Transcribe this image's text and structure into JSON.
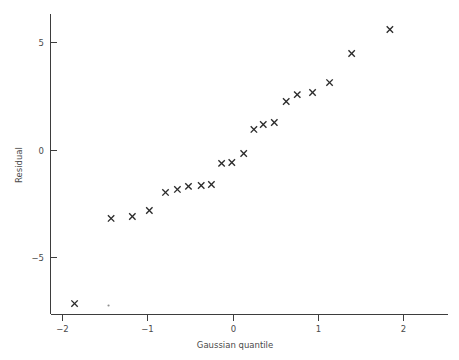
{
  "figure": {
    "background_color": "#ffffff",
    "ink_color": "#3d3d3d",
    "marker_color": "#2b2b2b",
    "marker_symbol": "x",
    "width": 459,
    "height": 360
  },
  "axes": {
    "x_title": "Gaussian quantile",
    "y_title": "Residual",
    "x_ticks": [
      "−2",
      "−1",
      "0",
      "1",
      "2"
    ],
    "y_ticks": [
      "5",
      "0",
      "−5"
    ],
    "x_tick_values": [
      -2,
      -1,
      0,
      1,
      2
    ],
    "y_tick_values": [
      5,
      0,
      -5
    ],
    "x_range": [
      -2.15,
      2.6
    ],
    "y_range": [
      -8.2,
      6.6
    ],
    "grid": false,
    "spine_left": true,
    "spine_bottom": true,
    "spine_top": false,
    "spine_right": false
  },
  "chart_data": {
    "type": "scatter",
    "title": "",
    "subtitle": "",
    "xlabel": "Gaussian quantile",
    "ylabel": "Residual",
    "xlim": [
      -2.15,
      2.6
    ],
    "ylim": [
      -8.2,
      6.6
    ],
    "xticks": [
      -2,
      -1,
      0,
      1,
      2
    ],
    "yticks": [
      5,
      0,
      -5
    ],
    "grid": false,
    "legend": null,
    "marker": "x",
    "series": [
      {
        "name": "residual quantiles",
        "x": [
          -1.87,
          -1.44,
          -1.19,
          -0.99,
          -0.8,
          -0.66,
          -0.53,
          -0.38,
          -0.26,
          -0.14,
          -0.02,
          0.12,
          0.24,
          0.35,
          0.48,
          0.62,
          0.75,
          0.93,
          1.13,
          1.39,
          1.84
        ],
        "y": [
          -7.12,
          -3.16,
          -3.07,
          -2.79,
          -1.95,
          -1.81,
          -1.67,
          -1.63,
          -1.58,
          -0.6,
          -0.56,
          -0.14,
          0.98,
          1.21,
          1.3,
          2.28,
          2.6,
          2.7,
          3.16,
          4.51,
          5.63
        ]
      }
    ],
    "artifacts": [
      {
        "name": "speck",
        "x": -1.47,
        "y": -7.21
      }
    ],
    "n_points": 21
  }
}
